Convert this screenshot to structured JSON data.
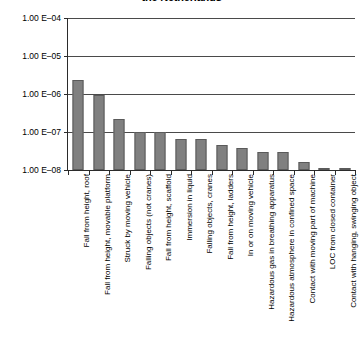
{
  "chart_data": {
    "type": "bar",
    "title": "the Netherlands",
    "xlabel": "",
    "ylabel": "",
    "yscale": "log",
    "ylim": [
      1e-08,
      0.0001
    ],
    "grid": true,
    "legend": null,
    "ytick_labels": [
      "1.00 E–04",
      "1.00 E–05",
      "1.00 E–06",
      "1.00 E–07",
      "1.00 E–08"
    ],
    "ytick_values": [
      0.0001,
      1e-05,
      1e-06,
      1e-07,
      1e-08
    ],
    "categories": [
      "Fall from height, roof",
      "Fall from height, movable platform",
      "Struck by moving vehicle",
      "Falling objects (not cranes)",
      "Fall from height, scaffold",
      "Immersion in liquid",
      "Falling objects, cranes",
      "Fall from height, ladders",
      "In or on moving vehicle",
      "Hazardous gas in breathing apparatus",
      "Hazardous atmosphere in confined space",
      "Contact with moving part of machine",
      "LOC from closed container",
      "Contact with hanging, swinging object"
    ],
    "values": [
      2.4e-06,
      9.5e-07,
      2.2e-07,
      1e-07,
      1e-07,
      6.5e-08,
      6.5e-08,
      4.5e-08,
      3.7e-08,
      3e-08,
      2.9e-08,
      1.6e-08,
      1.02e-08,
      1.05e-08
    ],
    "bar_color": "#808080",
    "bar_edge_color": "#5a5a5a",
    "grid_color": "#4a4a4a",
    "axis_color": "#2b2b2b"
  }
}
